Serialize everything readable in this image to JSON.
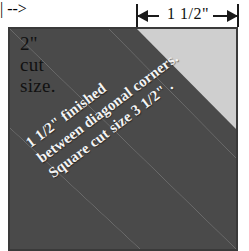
{
  "diagram": {
    "top_dimension": {
      "label": "1 1/2\"",
      "left_arrow": "left-arrow",
      "right_arrow": "right-arrow"
    },
    "corner_label": {
      "line1": "2\"",
      "line2": "cut",
      "line3": "size."
    },
    "band_caption": {
      "line1": "1 1/2\" finished",
      "line2": "between diagonal corners.",
      "line3": "Square cut size 3 1/2\" ."
    },
    "colors": {
      "background_square": "#cfcfcf",
      "diagonal_band": "#4a4a4a",
      "border": "#3a3a3a",
      "caption_text": "#f4f4f4",
      "label_text": "#111111"
    }
  }
}
